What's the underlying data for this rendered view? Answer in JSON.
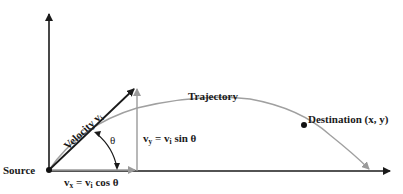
{
  "diagram": {
    "labels": {
      "source": "Source",
      "velocity": "Velocity v",
      "velocity_sub": "i",
      "theta": "θ",
      "vy_lhs": "v",
      "vy_lhs_sub": "y",
      "vy_eq": " = v",
      "vy_rhs_sub": "i",
      "vy_tail": " sin θ",
      "vx_lhs": "v",
      "vx_lhs_sub": "x",
      "vx_eq": " = v",
      "vx_rhs_sub": "i",
      "vx_tail": " cos θ",
      "trajectory": "Trajectory",
      "destination": "Destination (x, y)"
    },
    "colors": {
      "axis": "#1a1a1a",
      "velocity_vector": "#1a1a1a",
      "component_vectors": "#9a9a9a",
      "trajectory": "#a0a0a0",
      "points": "#111111"
    },
    "points": {
      "source": [
        49,
        170
      ],
      "velocity_tip": [
        135,
        88
      ],
      "destination": [
        304,
        125
      ],
      "landing": [
        371,
        171
      ]
    }
  }
}
